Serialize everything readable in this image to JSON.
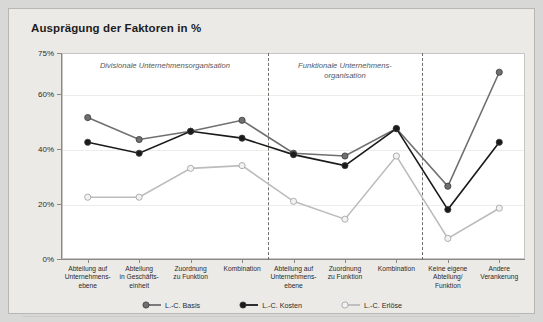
{
  "title": "Ausprägung der Faktoren in %",
  "axis": {
    "y_ticks": [
      "75%",
      "60%",
      "40%",
      "20%",
      "0%"
    ],
    "y_tick_values": [
      75,
      60,
      40,
      20,
      0
    ],
    "ymin": 0,
    "ymax": 75
  },
  "annotations": [
    {
      "name": "divisionale",
      "text": "Divisionale Unternehmensorganisation"
    },
    {
      "name": "funktionale",
      "line1": "Funktionale Unternehmens-",
      "line2": "organisation"
    }
  ],
  "legend": [
    {
      "label": "L.-C. Basis",
      "color": "#6f6f6f",
      "marker": "filled-gray"
    },
    {
      "label": "L.-C. Kosten",
      "color": "#1a1a1a",
      "marker": "filled-black"
    },
    {
      "label": "L.-C. Erlöse",
      "color": "#bcbcbc",
      "marker": "open-light"
    }
  ],
  "colors": {
    "frame_bg": "#eceae7",
    "page_bg": "#d8d8d6",
    "panel_bg": "#ffffff",
    "axis": "#8a8884",
    "grid": "#eeedea",
    "divider": "#6f6d6a",
    "basis": "#6f6f6f",
    "kosten": "#1a1a1a",
    "erloese": "#bcbcbc"
  },
  "chart_data": {
    "type": "line",
    "title": "Ausprägung der Faktoren in %",
    "xlabel": "",
    "ylabel": "",
    "ylim": [
      0,
      75
    ],
    "grid": true,
    "legend_position": "bottom",
    "categories": [
      "Abteilung auf Unternehmens-ebene",
      "Abteilung in Geschäfts-einheit",
      "Zuordnung zu Funktion",
      "Kombination",
      "Abteilung auf Unternehmens-ebene",
      "Zuordnung zu Funktion",
      "Kombination",
      "Keine eigene Abteilung/ Funktion",
      "Andere Verankerung"
    ],
    "category_lines": [
      [
        "Abteilung auf",
        "Unternehmens-",
        "ebene"
      ],
      [
        "Abteilung",
        "in Geschäfts-",
        "einheit"
      ],
      [
        "Zuordnung",
        "zu Funktion"
      ],
      [
        "Kombination"
      ],
      [
        "Abteilung auf",
        "Unternehmens-",
        "ebene"
      ],
      [
        "Zuordnung",
        "zu Funktion"
      ],
      [
        "Kombination"
      ],
      [
        "Keine eigene",
        "Abteilung/",
        "Funktion"
      ],
      [
        "Andere",
        "Verankerung"
      ]
    ],
    "series": [
      {
        "name": "L.-C. Basis",
        "color": "#6f6f6f",
        "values": [
          51.5,
          43.5,
          46.5,
          50.5,
          38.5,
          37.5,
          47.5,
          26.5,
          68.0
        ]
      },
      {
        "name": "L.-C. Kosten",
        "color": "#1a1a1a",
        "values": [
          42.5,
          38.5,
          46.5,
          44.0,
          38.0,
          34.0,
          47.5,
          18.0,
          42.5
        ]
      },
      {
        "name": "L.-C. Erlöse",
        "color": "#bcbcbc",
        "values": [
          22.5,
          22.5,
          33.0,
          34.0,
          21.0,
          14.5,
          37.5,
          7.5,
          18.5
        ]
      }
    ],
    "group_dividers_after_category_index": [
      3,
      6
    ]
  }
}
